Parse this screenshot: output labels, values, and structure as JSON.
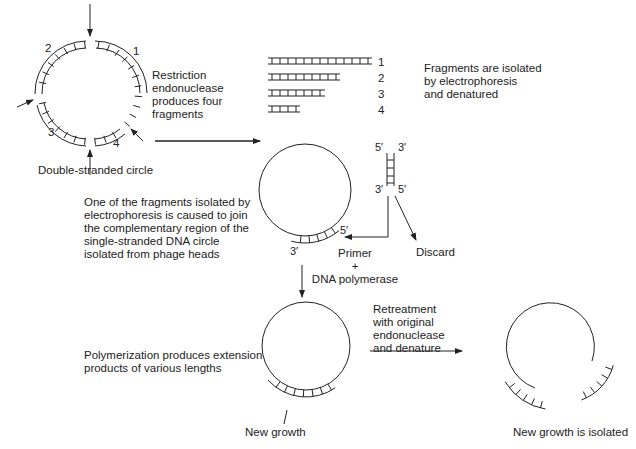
{
  "diagram": {
    "steps": {
      "restriction": "Restriction\nendonuclease\nproduces four\nfragments",
      "double_stranded": "Double-stranded circle",
      "electrophoresis": "Fragments are isolated\nby electrophoresis\nand denatured",
      "join": "One of the fragments isolated by\nelectrophoresis is caused to join\nthe complementary region of the\nsingle-stranded DNA circle\nisolated from phage heads",
      "primer": "Primer\n+\nDNA polymerase",
      "discard": "Discard",
      "polymerization": "Polymerization produces extension\nproducts of various lengths",
      "new_growth": "New growth",
      "retreatment": "Retreatment\nwith original\nendonuclease\nand denature",
      "new_growth_isolated": "New growth is isolated"
    },
    "circle_fragment_labels": [
      "1",
      "2",
      "3",
      "4"
    ],
    "fragment_list_labels": [
      "1",
      "2",
      "3",
      "4"
    ],
    "strand_ends": {
      "top_left": "5′",
      "top_right": "3′",
      "bottom_left": "3′",
      "bottom_right": "5′",
      "primer_5": "5′",
      "primer_3": "3′"
    }
  }
}
